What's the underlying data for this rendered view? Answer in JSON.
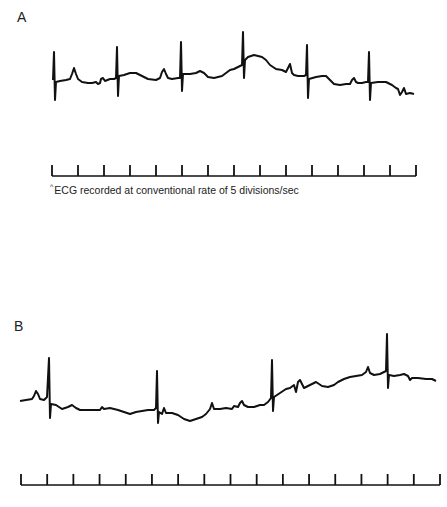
{
  "figure": {
    "panel_a_label": "A",
    "panel_b_label": "B",
    "caption_mark": "^",
    "caption": "ECG recorded at conventional rate of 5 divisions/sec",
    "trace_color": "#111111"
  },
  "chart_data": [
    {
      "type": "line",
      "title": "A",
      "description": "ECG rhythm strip A with 7 QRS complexes",
      "xlabel": "",
      "ylabel": "",
      "grid": false,
      "scale_bar": {
        "x_start": 52,
        "x_end": 416,
        "y": 176,
        "tick_count": 15,
        "tick_height": 11
      },
      "caption": "ECG recorded at conventional rate of 5 divisions/sec",
      "points": [
        [
          53,
          80
        ],
        [
          54,
          52
        ],
        [
          55,
          100
        ],
        [
          56,
          82
        ],
        [
          60,
          81
        ],
        [
          66,
          80
        ],
        [
          70,
          79
        ],
        [
          72,
          74
        ],
        [
          74,
          68
        ],
        [
          76,
          74
        ],
        [
          78,
          79
        ],
        [
          82,
          82
        ],
        [
          88,
          83
        ],
        [
          92,
          83
        ],
        [
          96,
          82
        ],
        [
          98,
          84
        ],
        [
          100,
          83
        ],
        [
          101,
          79
        ],
        [
          103,
          78
        ],
        [
          105,
          81
        ],
        [
          110,
          79
        ],
        [
          114,
          79
        ],
        [
          116,
          78
        ],
        [
          117,
          47
        ],
        [
          118,
          96
        ],
        [
          119,
          76
        ],
        [
          124,
          75
        ],
        [
          130,
          73
        ],
        [
          136,
          73
        ],
        [
          142,
          76
        ],
        [
          148,
          79
        ],
        [
          156,
          80
        ],
        [
          160,
          78
        ],
        [
          162,
          72
        ],
        [
          164,
          69
        ],
        [
          166,
          74
        ],
        [
          168,
          78
        ],
        [
          172,
          79
        ],
        [
          178,
          78
        ],
        [
          180,
          78
        ],
        [
          181,
          42
        ],
        [
          182,
          91
        ],
        [
          183,
          74
        ],
        [
          190,
          74
        ],
        [
          196,
          73
        ],
        [
          200,
          71
        ],
        [
          204,
          73
        ],
        [
          208,
          77
        ],
        [
          214,
          78
        ],
        [
          222,
          76
        ],
        [
          226,
          73
        ],
        [
          230,
          70
        ],
        [
          234,
          69
        ],
        [
          238,
          67
        ],
        [
          242,
          65
        ],
        [
          243,
          32
        ],
        [
          244,
          78
        ],
        [
          245,
          60
        ],
        [
          248,
          57
        ],
        [
          254,
          55
        ],
        [
          262,
          57
        ],
        [
          266,
          60
        ],
        [
          270,
          65
        ],
        [
          276,
          69
        ],
        [
          282,
          70
        ],
        [
          286,
          72
        ],
        [
          288,
          68
        ],
        [
          290,
          64
        ],
        [
          292,
          73
        ],
        [
          294,
          75
        ],
        [
          298,
          76
        ],
        [
          304,
          76
        ],
        [
          306,
          75
        ],
        [
          307,
          45
        ],
        [
          308,
          98
        ],
        [
          309,
          79
        ],
        [
          316,
          77
        ],
        [
          322,
          76
        ],
        [
          326,
          76
        ],
        [
          330,
          80
        ],
        [
          334,
          84
        ],
        [
          340,
          85
        ],
        [
          346,
          84
        ],
        [
          350,
          84
        ],
        [
          352,
          80
        ],
        [
          354,
          78
        ],
        [
          356,
          82
        ],
        [
          358,
          83
        ],
        [
          362,
          83
        ],
        [
          366,
          82
        ],
        [
          368,
          82
        ],
        [
          369,
          52
        ],
        [
          370,
          100
        ],
        [
          371,
          83
        ],
        [
          378,
          82
        ],
        [
          386,
          82
        ],
        [
          392,
          85
        ],
        [
          396,
          88
        ],
        [
          398,
          89
        ],
        [
          400,
          95
        ],
        [
          402,
          92
        ],
        [
          404,
          88
        ],
        [
          406,
          94
        ],
        [
          410,
          93
        ],
        [
          414,
          94
        ]
      ]
    },
    {
      "type": "line",
      "title": "B",
      "description": "ECG rhythm strip B with 4 QRS complexes",
      "xlabel": "",
      "ylabel": "",
      "grid": false,
      "scale_bar": {
        "x_start": 21,
        "x_end": 440,
        "y": 485,
        "tick_count": 17,
        "tick_height": 11
      },
      "points": [
        [
          20,
          401
        ],
        [
          26,
          400
        ],
        [
          32,
          399
        ],
        [
          34,
          396
        ],
        [
          36,
          391
        ],
        [
          38,
          394
        ],
        [
          40,
          399
        ],
        [
          44,
          400
        ],
        [
          47,
          397
        ],
        [
          49,
          358
        ],
        [
          50,
          418
        ],
        [
          51,
          404
        ],
        [
          56,
          405
        ],
        [
          62,
          409
        ],
        [
          68,
          407
        ],
        [
          72,
          405
        ],
        [
          76,
          408
        ],
        [
          80,
          410
        ],
        [
          88,
          410
        ],
        [
          96,
          410
        ],
        [
          100,
          410
        ],
        [
          102,
          407
        ],
        [
          104,
          409
        ],
        [
          110,
          408
        ],
        [
          118,
          410
        ],
        [
          124,
          412
        ],
        [
          130,
          414
        ],
        [
          136,
          412
        ],
        [
          142,
          411
        ],
        [
          148,
          410
        ],
        [
          154,
          410
        ],
        [
          156,
          408
        ],
        [
          157,
          371
        ],
        [
          158,
          423
        ],
        [
          159,
          412
        ],
        [
          162,
          414
        ],
        [
          164,
          408
        ],
        [
          166,
          413
        ],
        [
          172,
          413
        ],
        [
          178,
          415
        ],
        [
          184,
          419
        ],
        [
          190,
          421
        ],
        [
          196,
          419
        ],
        [
          202,
          417
        ],
        [
          206,
          414
        ],
        [
          210,
          409
        ],
        [
          212,
          403
        ],
        [
          214,
          409
        ],
        [
          220,
          409
        ],
        [
          226,
          408
        ],
        [
          232,
          409
        ],
        [
          234,
          406
        ],
        [
          238,
          407
        ],
        [
          240,
          403
        ],
        [
          242,
          401
        ],
        [
          244,
          405
        ],
        [
          248,
          407
        ],
        [
          254,
          407
        ],
        [
          260,
          405
        ],
        [
          264,
          405
        ],
        [
          268,
          402
        ],
        [
          271,
          398
        ],
        [
          272,
          360
        ],
        [
          273,
          411
        ],
        [
          274,
          397
        ],
        [
          280,
          393
        ],
        [
          286,
          389
        ],
        [
          290,
          388
        ],
        [
          294,
          385
        ],
        [
          296,
          392
        ],
        [
          298,
          382
        ],
        [
          300,
          380
        ],
        [
          304,
          388
        ],
        [
          308,
          386
        ],
        [
          312,
          384
        ],
        [
          316,
          382
        ],
        [
          322,
          386
        ],
        [
          328,
          387
        ],
        [
          334,
          385
        ],
        [
          338,
          382
        ],
        [
          344,
          379
        ],
        [
          350,
          377
        ],
        [
          356,
          376
        ],
        [
          362,
          375
        ],
        [
          366,
          372
        ],
        [
          368,
          367
        ],
        [
          370,
          373
        ],
        [
          374,
          375
        ],
        [
          380,
          374
        ],
        [
          384,
          372
        ],
        [
          386,
          371
        ],
        [
          387,
          334
        ],
        [
          388,
          388
        ],
        [
          389,
          375
        ],
        [
          394,
          376
        ],
        [
          400,
          375
        ],
        [
          404,
          374
        ],
        [
          408,
          376
        ],
        [
          410,
          380
        ],
        [
          412,
          378
        ],
        [
          418,
          378
        ],
        [
          426,
          379
        ],
        [
          432,
          379
        ],
        [
          436,
          381
        ]
      ]
    }
  ]
}
